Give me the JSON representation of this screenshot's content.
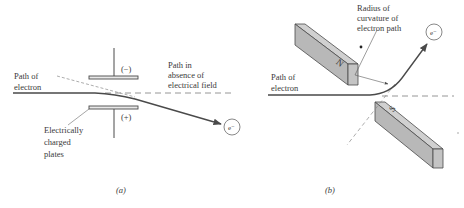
{
  "panel_a": {
    "caption": "(a)",
    "path_label": [
      "Path of",
      "electron"
    ],
    "no_field_label": [
      "Path in",
      "absence of",
      "electrical field"
    ],
    "plates_label": [
      "Electrically",
      "charged",
      "plates"
    ],
    "top_plate_sign": "(−)",
    "bottom_plate_sign": "(+)",
    "electron_symbol": "e⁻"
  },
  "panel_b": {
    "caption": "(b)",
    "path_label": [
      "Path of",
      "electron"
    ],
    "radius_label": [
      "Radius of",
      "curvature of",
      "electron path"
    ],
    "north_pole": "N",
    "south_pole": "S",
    "electron_symbol": "e⁻"
  },
  "colors": {
    "line": "#4a4a4a",
    "magnet_fill": "#b8b8b8",
    "magnet_dark": "#9a9a9a",
    "magnet_light": "#d0d0d0",
    "dashed": "#8a8a8a"
  }
}
